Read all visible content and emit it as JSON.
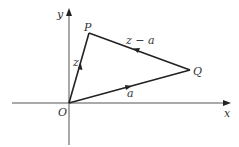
{
  "diagram": {
    "type": "vector-triangle",
    "axes": {
      "x_label": "x",
      "y_label": "y",
      "origin_label": "O"
    },
    "points": {
      "O": {
        "label": "O"
      },
      "P": {
        "label": "P"
      },
      "Q": {
        "label": "Q"
      }
    },
    "vectors": [
      {
        "from": "O",
        "to": "P",
        "label": "z"
      },
      {
        "from": "Q",
        "to": "P",
        "label": "z − a"
      },
      {
        "from": "O",
        "to": "Q",
        "label": "a"
      }
    ],
    "colors": {
      "line": "#222222",
      "axis": "#555555",
      "text": "#333333"
    }
  }
}
